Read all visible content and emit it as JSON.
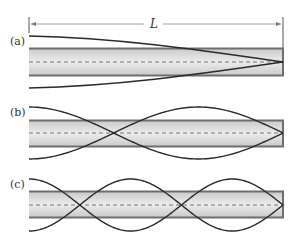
{
  "diagram": {
    "length_label": "L",
    "panels": [
      {
        "label": "(a)",
        "half_loops": 1,
        "description": "fundamental: antinode at open end, node at closed end"
      },
      {
        "label": "(b)",
        "half_loops": 3,
        "description": "third harmonic"
      },
      {
        "label": "(c)",
        "half_loops": 5,
        "description": "fifth harmonic"
      }
    ],
    "colors": {
      "tube_fill": "#d9d9d9",
      "tube_edge": "#6e6e6e",
      "curve": "#2a2a2a",
      "midline": "#666666"
    }
  }
}
